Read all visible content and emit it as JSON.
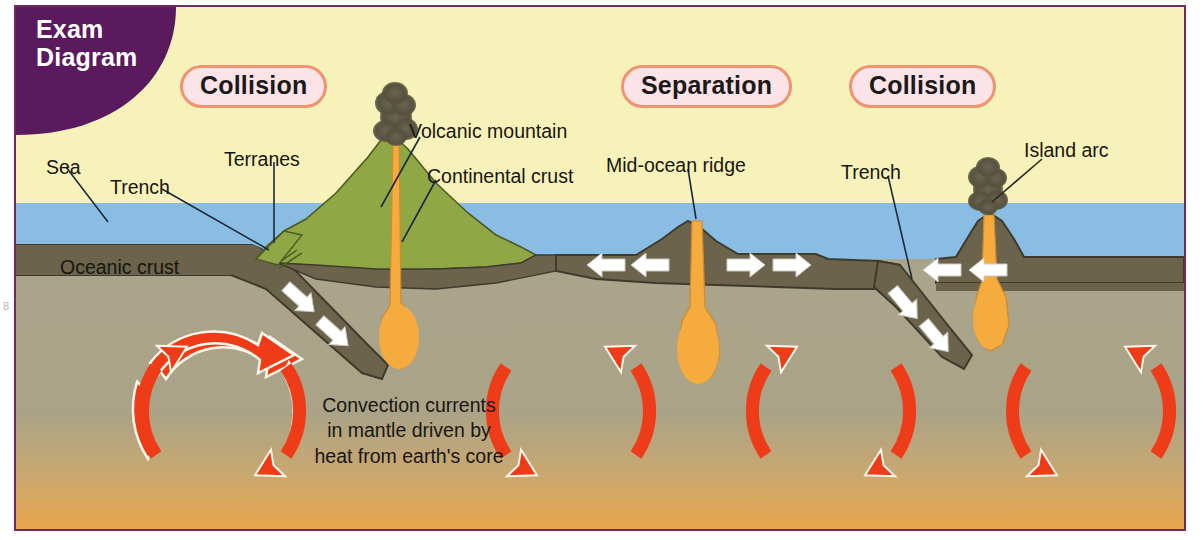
{
  "diagram": {
    "corner_badge": {
      "line1": "Exam",
      "line2": "Diagram",
      "bg_color": "#5b1a5e",
      "text_color": "#ffffff"
    },
    "page_marker": "8",
    "colors": {
      "sky": "#f7f2b9",
      "sea": "#89bde4",
      "oceanic_crust": "#6b634c",
      "continental_crust": "#8fa845",
      "mantle_top": "#a9a58c",
      "mantle_bottom": "#e8a54b",
      "magma": "#f5ab3e",
      "convection_arrow": "#ee3b18",
      "plate_arrow": "#ffffff",
      "smoke": "#57523f",
      "pill_bg": "#fbe3e8",
      "pill_border": "#ef9470",
      "frame_border": "#6e2b63"
    },
    "zone_badges": [
      {
        "label": "Collision",
        "x": 164,
        "y": 61
      },
      {
        "label": "Separation",
        "x": 605,
        "y": 61
      },
      {
        "label": "Collision",
        "x": 833,
        "y": 61
      }
    ],
    "labels": [
      {
        "name": "sea",
        "text": "Sea",
        "x": 30,
        "y": 148
      },
      {
        "name": "trench-left",
        "text": "Trench",
        "x": 94,
        "y": 168
      },
      {
        "name": "terranes",
        "text": "Terranes",
        "x": 222,
        "y": 142
      },
      {
        "name": "volcanic-mountain",
        "text": "Volcanic mountain",
        "x": 407,
        "y": 115
      },
      {
        "name": "continental-crust",
        "text": "Continental crust",
        "x": 424,
        "y": 159
      },
      {
        "name": "mid-ocean-ridge",
        "text": "Mid-ocean ridge",
        "x": 604,
        "y": 148
      },
      {
        "name": "trench-right",
        "text": "Trench",
        "x": 838,
        "y": 155
      },
      {
        "name": "island-arc",
        "text": "Island arc",
        "x": 1021,
        "y": 139
      },
      {
        "name": "oceanic-crust",
        "text": "Oceanic crust",
        "x": 58,
        "y": 253
      }
    ],
    "convection_caption": {
      "lines": [
        "Convection currents",
        "in mantle driven by",
        "heat from earth's core"
      ],
      "x": 396,
      "y": 396
    },
    "convection_cells": [
      {
        "name": "cell-1",
        "cx": 205,
        "cy": 404,
        "r": 85,
        "direction": "clockwise"
      },
      {
        "name": "cell-2",
        "cx": 555,
        "cy": 404,
        "r": 85,
        "direction": "counter-clockwise"
      },
      {
        "name": "cell-3",
        "cx": 815,
        "cy": 404,
        "r": 85,
        "direction": "clockwise"
      },
      {
        "name": "cell-4",
        "cx": 1075,
        "cy": 404,
        "r": 85,
        "direction": "counter-clockwise"
      }
    ],
    "plate_motion_arrows": [
      {
        "name": "arrow-subduction-left-a",
        "direction": "down-right"
      },
      {
        "name": "arrow-subduction-left-b",
        "direction": "down-right"
      },
      {
        "name": "arrow-ridge-west-a",
        "direction": "left"
      },
      {
        "name": "arrow-ridge-west-b",
        "direction": "left"
      },
      {
        "name": "arrow-ridge-east-a",
        "direction": "right"
      },
      {
        "name": "arrow-ridge-east-b",
        "direction": "right"
      },
      {
        "name": "arrow-subduction-right-a",
        "direction": "down-right"
      },
      {
        "name": "arrow-subduction-right-b",
        "direction": "down-right"
      },
      {
        "name": "arrow-island-arc-a",
        "direction": "left"
      },
      {
        "name": "arrow-island-arc-b",
        "direction": "left"
      }
    ]
  }
}
